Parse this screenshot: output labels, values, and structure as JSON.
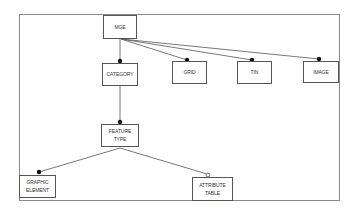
{
  "diagram": {
    "type": "entity-relationship hierarchy",
    "frame": {
      "x": 19,
      "y": 14,
      "width": 321,
      "height": 187,
      "color": "#8a8a8a"
    },
    "line_color": "#555555",
    "entities": {
      "mge": {
        "lines": [
          "MGE"
        ],
        "x": 103,
        "y": 15,
        "width": 34,
        "height": 24
      },
      "category": {
        "lines": [
          "CATEGORY"
        ],
        "x": 102,
        "y": 63,
        "width": 36,
        "height": 23
      },
      "grid": {
        "lines": [
          "GRID"
        ],
        "x": 172,
        "y": 61,
        "width": 35,
        "height": 23
      },
      "tin": {
        "lines": [
          "TIN"
        ],
        "x": 237,
        "y": 61,
        "width": 35,
        "height": 23
      },
      "image": {
        "lines": [
          "IMAGE"
        ],
        "x": 303,
        "y": 61,
        "width": 36,
        "height": 22
      },
      "feature_type": {
        "lines": [
          "FEATURE",
          "TYPE"
        ],
        "x": 101,
        "y": 124,
        "width": 38,
        "height": 23
      },
      "graphic_element": {
        "lines": [
          "GRAPHIC",
          "ELEMENT"
        ],
        "x": 19,
        "y": 175,
        "width": 37,
        "height": 23
      },
      "attribute_table": {
        "lines": [
          "ATTRIBUTE",
          "TABLE"
        ],
        "x": 192,
        "y": 177,
        "width": 41,
        "height": 24
      }
    },
    "relationships": [
      {
        "from": "MGE",
        "to": "CATEGORY",
        "end_marker": "filled-circle",
        "x1": 120,
        "y1": 39,
        "x2": 120,
        "y2": 61
      },
      {
        "from": "MGE",
        "to": "GRID",
        "end_marker": "filled-circle",
        "x1": 121,
        "y1": 39,
        "x2": 187,
        "y2": 61
      },
      {
        "from": "MGE",
        "to": "TIN",
        "end_marker": "filled-circle",
        "x1": 121,
        "y1": 39,
        "x2": 252,
        "y2": 61
      },
      {
        "from": "MGE",
        "to": "IMAGE",
        "end_marker": "filled-circle",
        "x1": 121,
        "y1": 39,
        "x2": 319,
        "y2": 60
      },
      {
        "from": "CATEGORY",
        "to": "FEATURE TYPE",
        "end_marker": "filled-circle",
        "x1": 120,
        "y1": 86,
        "x2": 120,
        "y2": 122
      },
      {
        "from": "FEATURE TYPE",
        "to": "GRAPHIC ELEMENT",
        "end_marker": "filled-circle",
        "x1": 120,
        "y1": 148,
        "x2": 39,
        "y2": 172
      },
      {
        "from": "FEATURE TYPE",
        "to": "ATTRIBUTE TABLE",
        "end_marker": "hollow-circle",
        "x1": 120,
        "y1": 148,
        "x2": 208,
        "y2": 175
      }
    ]
  }
}
